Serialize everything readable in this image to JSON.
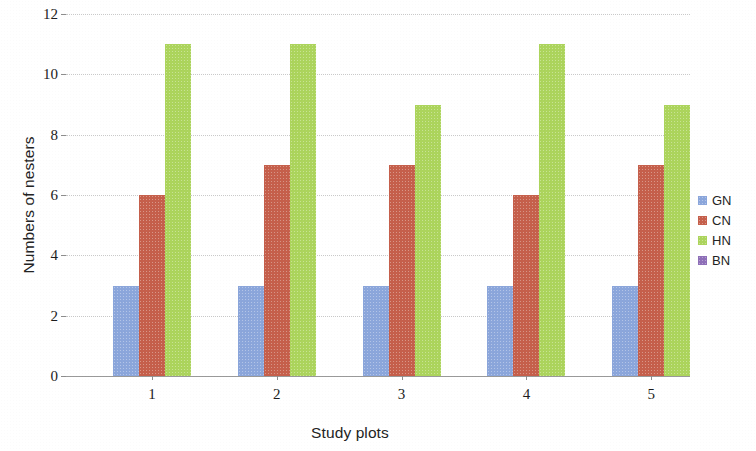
{
  "chart_data": {
    "type": "bar",
    "title": "",
    "xlabel": "Study plots",
    "ylabel": "Numbers of nesters",
    "categories": [
      "1",
      "2",
      "3",
      "4",
      "5"
    ],
    "series": [
      {
        "name": "GN",
        "color": "#8BA6DB",
        "values": [
          3,
          3,
          3,
          3,
          3
        ]
      },
      {
        "name": "CN",
        "color": "#C55F4B",
        "values": [
          6,
          7,
          7,
          6,
          7
        ]
      },
      {
        "name": "HN",
        "color": "#ACD45C",
        "values": [
          11,
          11,
          9,
          11,
          9
        ]
      },
      {
        "name": "BN",
        "color": "#8E6FB8",
        "values": [
          0,
          0,
          0,
          0,
          0
        ]
      }
    ],
    "ylim": [
      0,
      12
    ],
    "yticks": [
      "0",
      "2",
      "4",
      "6",
      "8",
      "10",
      "12"
    ],
    "grid": true,
    "legend_position": "right"
  }
}
